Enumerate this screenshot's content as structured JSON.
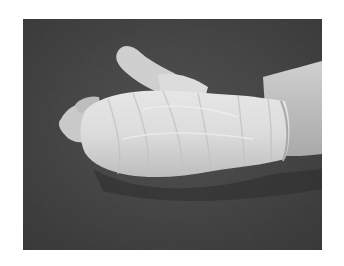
{
  "image": {
    "alt": "Grayscale photograph of a hand and wrist wrapped in a white bandage, resting on a dark textured surface",
    "subject": "bandaged hand",
    "colors": {
      "background_dark": "#474747",
      "bandage": "#d9d9d9",
      "bandage_highlight": "#ececec",
      "skin": "#c4c4c4",
      "shadow": "#2e2e2e",
      "border": "#ffffff"
    }
  }
}
